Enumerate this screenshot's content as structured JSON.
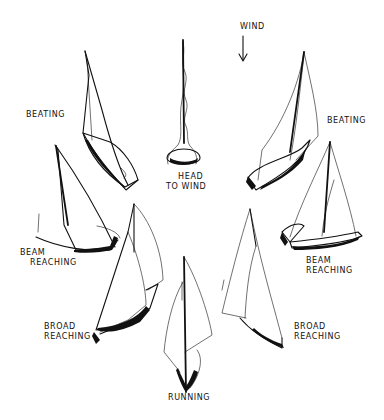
{
  "figure": {
    "wind": {
      "label": "WIND",
      "direction": "down"
    },
    "positions": [
      {
        "id": "head-to-wind",
        "line1": "HEAD",
        "line2": "TO WIND"
      },
      {
        "id": "beating-left",
        "line1": "BEATING",
        "line2": ""
      },
      {
        "id": "beating-right",
        "line1": "BEATING",
        "line2": ""
      },
      {
        "id": "beam-reaching-left",
        "line1": "BEAM",
        "line2": "REACHING"
      },
      {
        "id": "beam-reaching-right",
        "line1": "BEAM",
        "line2": "REACHING"
      },
      {
        "id": "broad-reaching-left",
        "line1": "BROAD",
        "line2": "REACHING"
      },
      {
        "id": "broad-reaching-right",
        "line1": "BROAD",
        "line2": "REACHING"
      },
      {
        "id": "running",
        "line1": "RUNNING",
        "line2": ""
      }
    ]
  }
}
